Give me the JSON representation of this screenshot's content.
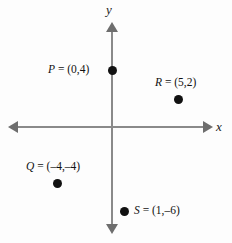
{
  "figure": {
    "type": "coordinate-plane",
    "background_color": "#fdfdfd",
    "axis_color": "#8a8a8a",
    "point_color": "#111111",
    "axes": {
      "x_label": "x",
      "y_label": "y",
      "x_arrow_left": "arrow-left",
      "x_arrow_right": "arrow-right",
      "y_arrow_up": "arrow-up",
      "y_arrow_down": "arrow-down"
    },
    "points": [
      {
        "id": "P",
        "label": "P = (0,4)",
        "x": 0,
        "y": 4,
        "label_position": "left"
      },
      {
        "id": "R",
        "label": "R = (5,2)",
        "x": 5,
        "y": 2,
        "label_position": "above"
      },
      {
        "id": "Q",
        "label": "Q = (–4,–4)",
        "x": -4,
        "y": -4,
        "label_position": "above"
      },
      {
        "id": "S",
        "label": "S = (1,–6)",
        "x": 1,
        "y": -6,
        "label_position": "right"
      }
    ]
  },
  "chart_data": {
    "type": "scatter",
    "title": "",
    "xlabel": "x",
    "ylabel": "y",
    "grid": false,
    "legend": "none",
    "xlim": [
      -8,
      8
    ],
    "ylim": [
      -8,
      8
    ],
    "series": [
      {
        "name": "points",
        "points": [
          {
            "label": "P",
            "x": 0,
            "y": 4
          },
          {
            "label": "R",
            "x": 5,
            "y": 2
          },
          {
            "label": "Q",
            "x": -4,
            "y": -4
          },
          {
            "label": "S",
            "x": 1,
            "y": -6
          }
        ]
      }
    ]
  }
}
